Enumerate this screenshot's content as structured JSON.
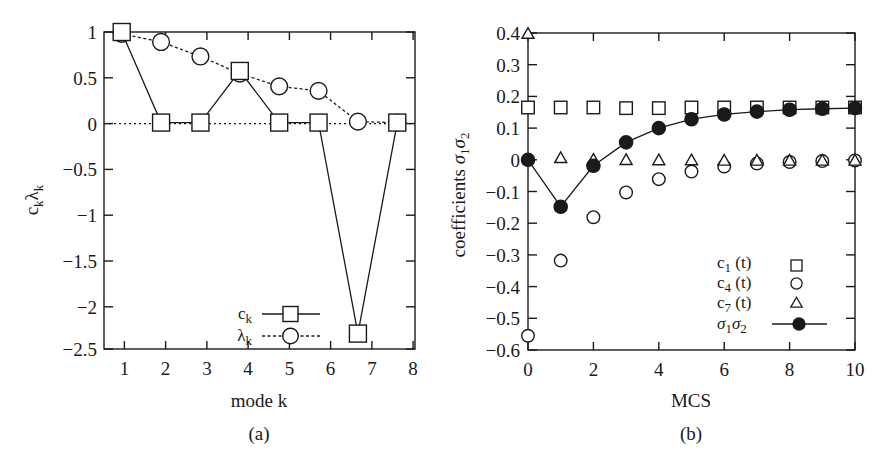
{
  "figure": {
    "width": 878,
    "height": 462,
    "background": "#ffffff",
    "ink": "#1a1a1a"
  },
  "panels": [
    {
      "id": "a",
      "caption": "(a)",
      "xlabel": "mode k",
      "ylabel_main": "c",
      "ylabel_sub1": "k",
      "ylabel_lambda": "λ",
      "ylabel_sub2": "k",
      "ylabel_plain": "c_k λ_k",
      "xticks": [
        "1",
        "2",
        "3",
        "4",
        "5",
        "6",
        "7",
        "8"
      ],
      "yticks": [
        "1",
        "0.5",
        "0",
        "−0.5",
        "−1",
        "−1.5",
        "−2",
        "−2.5"
      ],
      "legend": [
        {
          "label_main": "c",
          "label_sub": "k",
          "marker": "square-open",
          "line": "solid"
        },
        {
          "label_main": "λ",
          "label_sub": "k",
          "marker": "circle-open",
          "line": "dashed"
        }
      ]
    },
    {
      "id": "b",
      "caption": "(b)",
      "xlabel": "MCS",
      "ylabel": "coefficients σ₁σ₂",
      "ylabel_word": "coefficients",
      "ylabel_sym1": "σ",
      "ylabel_sym1_sub": "1",
      "ylabel_sym2": "σ",
      "ylabel_sym2_sub": "2",
      "xticks": [
        "0",
        "2",
        "4",
        "6",
        "8",
        "10"
      ],
      "yticks": [
        "0.4",
        "0.3",
        "0.2",
        "0.1",
        "0",
        "−0.1",
        "−0.2",
        "−0.3",
        "−0.4",
        "−0.5",
        "−0.6"
      ],
      "legend": [
        {
          "label_main": "c",
          "label_sub": "1",
          "label_tail": " (t)",
          "marker": "square-open",
          "line": "none"
        },
        {
          "label_main": "c",
          "label_sub": "4",
          "label_tail": " (t)",
          "marker": "circle-open",
          "line": "none"
        },
        {
          "label_main": "c",
          "label_sub": "7",
          "label_tail": " (t)",
          "marker": "triangle-open",
          "line": "none"
        },
        {
          "label_main": "σ",
          "label_sub": "1",
          "label_main2": "σ",
          "label_sub2": "2",
          "marker": "circle-filled",
          "line": "solid"
        }
      ]
    }
  ],
  "chart_data": [
    {
      "type": "line",
      "panel": "a",
      "title": "",
      "caption": "(a)",
      "xlabel": "mode k",
      "ylabel": "c_k λ_k",
      "x": [
        1,
        2,
        3,
        4,
        5,
        6,
        7,
        8
      ],
      "xlim": [
        0.55,
        8.45
      ],
      "ylim": [
        -2.5,
        1.0
      ],
      "xticks": [
        1,
        2,
        3,
        4,
        5,
        6,
        7,
        8
      ],
      "yticks": [
        1,
        0.5,
        0,
        -0.5,
        -1,
        -1.5,
        -2,
        -2.5
      ],
      "grid": false,
      "zero_line": true,
      "legend_position": "inside-lower-center-right",
      "series": [
        {
          "name": "c_k",
          "marker": "square-open",
          "linestyle": "solid",
          "values": [
            1.0,
            0.0,
            0.0,
            0.57,
            0.0,
            0.0,
            -2.33,
            0.0
          ]
        },
        {
          "name": "λ_k",
          "marker": "circle-open",
          "linestyle": "dashed",
          "values": [
            0.98,
            0.89,
            0.73,
            0.54,
            0.4,
            0.35,
            0.01,
            0.0
          ]
        }
      ]
    },
    {
      "type": "scatter",
      "panel": "b",
      "title": "",
      "caption": "(b)",
      "xlabel": "MCS",
      "ylabel": "coefficients σ₁σ₂",
      "x": [
        0,
        1,
        2,
        3,
        4,
        5,
        6,
        7,
        8,
        9,
        10
      ],
      "xlim": [
        0,
        10
      ],
      "ylim": [
        -0.6,
        0.4
      ],
      "xticks": [
        0,
        2,
        4,
        6,
        8,
        10
      ],
      "yticks": [
        0.4,
        0.3,
        0.2,
        0.1,
        0,
        -0.1,
        -0.2,
        -0.3,
        -0.4,
        -0.5,
        -0.6
      ],
      "grid": false,
      "legend_position": "inside-lower-right",
      "series": [
        {
          "name": "c_1 (t)",
          "marker": "square-open",
          "linestyle": "none",
          "values": [
            0.165,
            0.165,
            0.165,
            0.163,
            0.163,
            0.165,
            0.165,
            0.165,
            0.165,
            0.165,
            0.165
          ]
        },
        {
          "name": "c_4 (t)",
          "marker": "circle-open",
          "linestyle": "none",
          "values": [
            -0.555,
            -0.318,
            -0.181,
            -0.103,
            -0.061,
            -0.037,
            -0.021,
            -0.012,
            -0.007,
            -0.004,
            -0.002
          ]
        },
        {
          "name": "c_7 (t)",
          "marker": "triangle-open",
          "linestyle": "none",
          "values": [
            0.4,
            0.008,
            0.003,
            0.002,
            0.001,
            0.001,
            0.0,
            0.0,
            0.0,
            0.0,
            0.0
          ]
        },
        {
          "name": "σ_1σ_2",
          "marker": "circle-filled",
          "linestyle": "solid",
          "values": [
            0.0,
            -0.148,
            -0.019,
            0.055,
            0.1,
            0.128,
            0.143,
            0.152,
            0.158,
            0.161,
            0.163
          ]
        }
      ]
    }
  ]
}
